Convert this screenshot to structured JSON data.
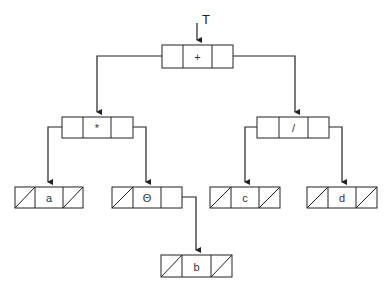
{
  "diagram": {
    "type": "expression-tree-linked-representation",
    "root_pointer_label": "T",
    "nodes": [
      {
        "id": "n-plus",
        "value": "+",
        "x": 162,
        "y": 45,
        "left": "pointer",
        "right": "pointer"
      },
      {
        "id": "n-times",
        "value": "*",
        "x": 62,
        "y": 117,
        "left": "pointer",
        "right": "pointer"
      },
      {
        "id": "n-div",
        "value": "/",
        "x": 257,
        "y": 117,
        "left": "pointer",
        "right": "pointer"
      },
      {
        "id": "n-a",
        "value": "a",
        "x": 15,
        "y": 187,
        "left": "null",
        "right": "null"
      },
      {
        "id": "n-neg",
        "value": "Θ",
        "x": 112,
        "y": 187,
        "left": "null",
        "right": "pointer"
      },
      {
        "id": "n-c",
        "value": "c",
        "x": 210,
        "y": 187,
        "left": "null",
        "right": "null"
      },
      {
        "id": "n-d",
        "value": "d",
        "x": 307,
        "y": 187,
        "left": "null",
        "right": "null"
      },
      {
        "id": "n-b",
        "value": "b",
        "x": 161,
        "y": 255,
        "left": "null",
        "right": "null"
      }
    ],
    "edges": [
      {
        "from": "n-plus",
        "side": "left",
        "to": "n-times"
      },
      {
        "from": "n-plus",
        "side": "right",
        "to": "n-div"
      },
      {
        "from": "n-times",
        "side": "left",
        "to": "n-a"
      },
      {
        "from": "n-times",
        "side": "right",
        "to": "n-neg"
      },
      {
        "from": "n-div",
        "side": "left",
        "to": "n-c"
      },
      {
        "from": "n-div",
        "side": "right",
        "to": "n-d"
      },
      {
        "from": "n-neg",
        "side": "right",
        "to": "n-b"
      }
    ],
    "colors": {
      "stroke": "#222222",
      "background": "#ffffff"
    }
  }
}
